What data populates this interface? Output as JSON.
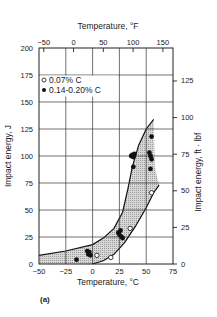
{
  "chart_data": {
    "type": "scatter",
    "title": "",
    "panel_label": "(a)",
    "xlabel": "Temperature, °C",
    "xlabel_top": "Temperature, °F",
    "ylabel": "Impact energy, J",
    "ylabel_right": "Impact energy, ft · lbf",
    "xlim": [
      -50,
      75
    ],
    "ylim": [
      0,
      200
    ],
    "x_ticks": [
      "−50",
      "−25",
      "0",
      "25",
      "50",
      "75"
    ],
    "x_ticks_top": [
      "−50",
      "0",
      "50",
      "100",
      "150"
    ],
    "y_ticks": [
      "0",
      "25",
      "50",
      "75",
      "100",
      "125",
      "150",
      "175",
      "200"
    ],
    "y_ticks_right": [
      "0",
      "25",
      "50",
      "75",
      "100",
      "125"
    ],
    "grid": true,
    "legend": {
      "position": "upper-left",
      "entries": [
        {
          "marker": "open-circle",
          "label": "0.07% C"
        },
        {
          "marker": "filled-circle",
          "label": "0.14-0.20% C"
        }
      ]
    },
    "series": [
      {
        "name": "0.07% C",
        "marker": "open-circle",
        "points": [
          [
            4,
            8
          ],
          [
            17,
            6
          ],
          [
            35,
            33
          ],
          [
            55,
            66
          ]
        ]
      },
      {
        "name": "0.14-0.20% C",
        "marker": "filled-circle",
        "points": [
          [
            -15,
            4
          ],
          [
            -5,
            12
          ],
          [
            -4,
            9
          ],
          [
            -3,
            11
          ],
          [
            -2,
            8
          ],
          [
            24,
            29
          ],
          [
            25,
            27
          ],
          [
            26,
            31
          ],
          [
            27,
            25
          ],
          [
            28,
            24
          ],
          [
            36,
            100
          ],
          [
            37,
            101
          ],
          [
            38,
            99
          ],
          [
            39,
            102
          ],
          [
            38,
            90
          ],
          [
            53,
            103
          ],
          [
            54,
            100
          ],
          [
            55,
            97
          ],
          [
            54,
            88
          ],
          [
            55,
            118
          ]
        ]
      }
    ],
    "scatter_band": {
      "description": "Shaded transition band enclosing data",
      "upper_curve": [
        [
          -50,
          8
        ],
        [
          -25,
          12
        ],
        [
          0,
          18
        ],
        [
          10,
          24
        ],
        [
          20,
          33
        ],
        [
          28,
          48
        ],
        [
          33,
          70
        ],
        [
          37,
          90
        ],
        [
          43,
          110
        ],
        [
          50,
          125
        ],
        [
          57,
          134
        ]
      ],
      "lower_curve": [
        [
          -50,
          0
        ],
        [
          0,
          0
        ],
        [
          10,
          3
        ],
        [
          20,
          9
        ],
        [
          30,
          20
        ],
        [
          40,
          35
        ],
        [
          50,
          52
        ],
        [
          57,
          66
        ],
        [
          62,
          73
        ]
      ]
    }
  }
}
